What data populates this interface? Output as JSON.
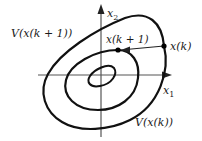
{
  "diagram": {
    "type": "lyapunov-level-sets",
    "axes": {
      "x_label": "x",
      "x_sub": "1",
      "y_label": "x",
      "y_sub": "2"
    },
    "labels": {
      "outer_level": "V(x(k+1))",
      "outer_level_display": "V(x(k + 1))",
      "inner_level": "V(x(k))",
      "point_k": "x(k)",
      "point_k1": "x(k + 1)"
    },
    "colors": {
      "curve": "#111111",
      "axis": "#555555",
      "text": "#1a1a1a",
      "background": "#ffffff"
    }
  }
}
